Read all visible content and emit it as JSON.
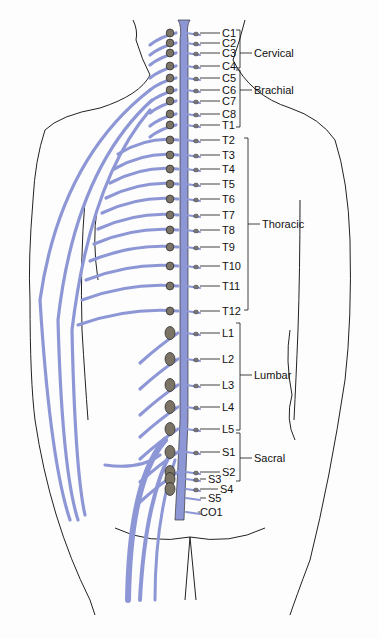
{
  "diagram": {
    "nerve_color": "#8e97d6",
    "outline_color": "#222222",
    "segments": [
      {
        "label": "C1",
        "x": 222,
        "y": 28
      },
      {
        "label": "C2",
        "x": 222,
        "y": 38
      },
      {
        "label": "C3",
        "x": 222,
        "y": 48
      },
      {
        "label": "C4",
        "x": 222,
        "y": 61
      },
      {
        "label": "C5",
        "x": 222,
        "y": 73
      },
      {
        "label": "C6",
        "x": 222,
        "y": 85
      },
      {
        "label": "C7",
        "x": 222,
        "y": 96
      },
      {
        "label": "C8",
        "x": 222,
        "y": 109
      },
      {
        "label": "T1",
        "x": 222,
        "y": 120
      },
      {
        "label": "T2",
        "x": 222,
        "y": 135
      },
      {
        "label": "T3",
        "x": 222,
        "y": 150
      },
      {
        "label": "T4",
        "x": 222,
        "y": 164
      },
      {
        "label": "T5",
        "x": 222,
        "y": 179
      },
      {
        "label": "T6",
        "x": 222,
        "y": 194
      },
      {
        "label": "T7",
        "x": 222,
        "y": 210
      },
      {
        "label": "T8",
        "x": 222,
        "y": 225
      },
      {
        "label": "T9",
        "x": 222,
        "y": 242
      },
      {
        "label": "T10",
        "x": 222,
        "y": 261
      },
      {
        "label": "T11",
        "x": 222,
        "y": 281
      },
      {
        "label": "T12",
        "x": 222,
        "y": 306
      },
      {
        "label": "L1",
        "x": 222,
        "y": 328
      },
      {
        "label": "L2",
        "x": 222,
        "y": 354
      },
      {
        "label": "L3",
        "x": 222,
        "y": 380
      },
      {
        "label": "L4",
        "x": 222,
        "y": 402
      },
      {
        "label": "L5",
        "x": 222,
        "y": 424
      },
      {
        "label": "S1",
        "x": 222,
        "y": 447
      },
      {
        "label": "S2",
        "x": 222,
        "y": 467
      },
      {
        "label": "S3",
        "x": 208,
        "y": 474
      },
      {
        "label": "S4",
        "x": 220,
        "y": 484
      },
      {
        "label": "S5",
        "x": 208,
        "y": 493
      },
      {
        "label": "CO1",
        "x": 200,
        "y": 507
      }
    ],
    "groups": [
      {
        "label": "Cervical",
        "x": 254,
        "y": 48,
        "bracket_top": 30,
        "bracket_bottom": 68,
        "bx": 240
      },
      {
        "label": "Brachial",
        "x": 254,
        "y": 85,
        "bracket_top": 70,
        "bracket_bottom": 127,
        "bx": 240
      },
      {
        "label": "Thoracic",
        "x": 262,
        "y": 219,
        "bracket_top": 138,
        "bracket_bottom": 310,
        "bx": 248
      },
      {
        "label": "Lumbar",
        "x": 254,
        "y": 370,
        "bracket_top": 323,
        "bracket_bottom": 430,
        "bx": 240
      },
      {
        "label": "Sacral",
        "x": 254,
        "y": 453,
        "bracket_top": 433,
        "bracket_bottom": 481,
        "bx": 240
      }
    ]
  }
}
